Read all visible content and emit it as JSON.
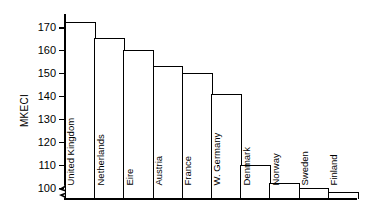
{
  "chart_data": {
    "type": "bar",
    "title": "",
    "xlabel": "",
    "ylabel": "MKECI",
    "categories": [
      "United Kingdom",
      "Netherlands",
      "Eire",
      "Austria",
      "France",
      "W. Germany",
      "Denmark",
      "Norway",
      "Sweden",
      "Finland"
    ],
    "values": [
      173,
      166,
      161,
      154,
      151,
      142,
      111,
      103,
      101,
      99
    ],
    "ylim": [
      96,
      176
    ],
    "yticks": [
      100,
      110,
      120,
      130,
      140,
      150,
      160,
      170
    ],
    "ytick_labels": [
      "100",
      "110",
      "120",
      "130",
      "140",
      "150",
      "160",
      "170"
    ],
    "grid": false,
    "legend": false,
    "axis_break": true,
    "axis_break_symbol": "zigzag",
    "bar_fill_color": "#ffffff",
    "bar_edge_color": "#000000",
    "background_color": "#ffffff",
    "label_orientation": "vertical-90"
  }
}
